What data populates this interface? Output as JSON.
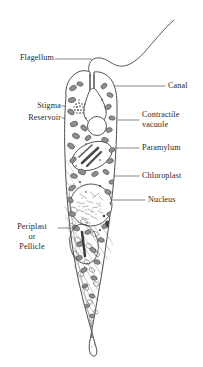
{
  "figure": {
    "organism": "Euglena",
    "background_color": "#ffffff",
    "ink_color": "#3a3a3a",
    "text_color": "#2a2a2a",
    "canvas": {
      "width": 203,
      "height": 367
    }
  },
  "labels": {
    "flagellum": {
      "text": "Flagellum",
      "side": "left",
      "x": 6,
      "y": 55,
      "leader": {
        "x1": 55,
        "y1": 59,
        "x2": 92,
        "y2": 59
      }
    },
    "stigma": {
      "text": "Stigma",
      "side": "left",
      "x": 25,
      "y": 102,
      "leader": {
        "x1": 62,
        "y1": 106,
        "x2": 86,
        "y2": 106
      }
    },
    "reservoir": {
      "text": "Reservoir",
      "side": "left",
      "x": 15,
      "y": 114,
      "leader": {
        "x1": 62,
        "y1": 118,
        "x2": 89,
        "y2": 118
      }
    },
    "periplast": {
      "text": "Periplast",
      "side": "left",
      "x": 12,
      "y": 224,
      "leader": {
        "x1": 58,
        "y1": 228,
        "x2": 76,
        "y2": 228
      }
    },
    "periplast_or": {
      "text": "or",
      "side": "center",
      "x": 12,
      "y": 234
    },
    "periplast_pellicle": {
      "text": "Pellicle",
      "side": "center",
      "x": 12,
      "y": 244
    },
    "canal": {
      "text": "Canal",
      "side": "right",
      "x": 168,
      "y": 82,
      "leader": {
        "x1": 110,
        "y1": 86,
        "x2": 165,
        "y2": 86
      }
    },
    "contractile_vacuole_line1": {
      "text": "Contractile",
      "side": "right",
      "x": 142,
      "y": 111,
      "leader": {
        "x1": 118,
        "y1": 120,
        "x2": 139,
        "y2": 120
      }
    },
    "contractile_vacuole_line2": {
      "text": "vacuole",
      "side": "right",
      "x": 142,
      "y": 121
    },
    "paramylum": {
      "text": "Paramylum",
      "side": "right",
      "x": 142,
      "y": 144,
      "leader": {
        "x1": 113,
        "y1": 148,
        "x2": 139,
        "y2": 148
      }
    },
    "chloroplast": {
      "text": "Chloroplast",
      "side": "right",
      "x": 142,
      "y": 172,
      "leader": {
        "x1": 113,
        "y1": 176,
        "x2": 139,
        "y2": 176
      }
    },
    "nucleus": {
      "text": "Nucleus",
      "side": "right",
      "x": 148,
      "y": 196,
      "leader": {
        "x1": 113,
        "y1": 200,
        "x2": 145,
        "y2": 200
      }
    }
  },
  "structures": {
    "flagellum": {
      "name": "flagellum",
      "description": "long wavy whip extending up and to the right from the anterior canal"
    },
    "canal": {
      "name": "canal",
      "description": "narrow anterior gullet opening"
    },
    "reservoir": {
      "name": "reservoir",
      "description": "pear-shaped clear sac below the canal"
    },
    "contractile_vacuole": {
      "name": "contractile-vacuole",
      "description": "round clear vesicle beneath the reservoir",
      "cx": 97,
      "cy": 124,
      "r": 9.5
    },
    "stigma": {
      "name": "stigma",
      "description": "small stippled red eyespot beside the reservoir",
      "cx": 80,
      "cy": 108
    },
    "paramylum": {
      "name": "paramylum",
      "description": "elongate oval storage body with diagonal rods",
      "cx": 93,
      "cy": 155
    },
    "nucleus": {
      "name": "nucleus",
      "description": "large stippled round nucleus in mid body",
      "cx": 92,
      "cy": 204,
      "r": 21
    },
    "chloroplasts": {
      "name": "chloroplasts",
      "description": "numerous dark lens-shaped plastids scattered through cytoplasm",
      "count": 46
    },
    "pellicle": {
      "name": "pellicle",
      "description": "diagonal striations along the posterior body wall"
    },
    "body": {
      "name": "cell-body",
      "description": "elongate spindle body tapering to a curved point at the posterior"
    }
  }
}
